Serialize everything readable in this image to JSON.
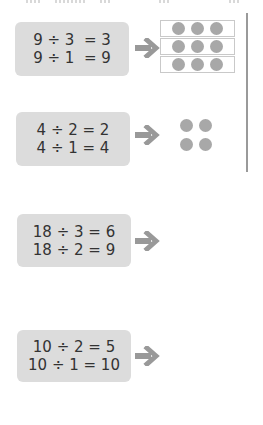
{
  "problems": [
    {
      "lines": [
        "9 ÷ 3  = 3",
        "9 ÷ 1  = 9"
      ],
      "arrow_icon": "right-arrow-icon",
      "illustration": {
        "type": "dot-rows",
        "rows": 3,
        "dots_per_row": 3
      }
    },
    {
      "lines": [
        "4 ÷ 2 = 2",
        "4 ÷ 1 = 4"
      ],
      "arrow_icon": "right-arrow-icon",
      "illustration": {
        "type": "dot-square",
        "rows": 2,
        "dots_per_row": 2
      }
    },
    {
      "lines": [
        "18 ÷ 3 = 6",
        "18 ÷ 2 = 9"
      ],
      "arrow_icon": "right-arrow-icon",
      "illustration": null
    },
    {
      "lines": [
        "10 ÷ 2 = 5",
        "10 ÷ 1 = 10"
      ],
      "arrow_icon": "right-arrow-icon",
      "illustration": null
    }
  ],
  "colors": {
    "box_background": "#dcdcdc",
    "text": "#333333",
    "arrow": "#999999",
    "dot": "#a8a8a8",
    "divider": "#9a9a9a"
  }
}
